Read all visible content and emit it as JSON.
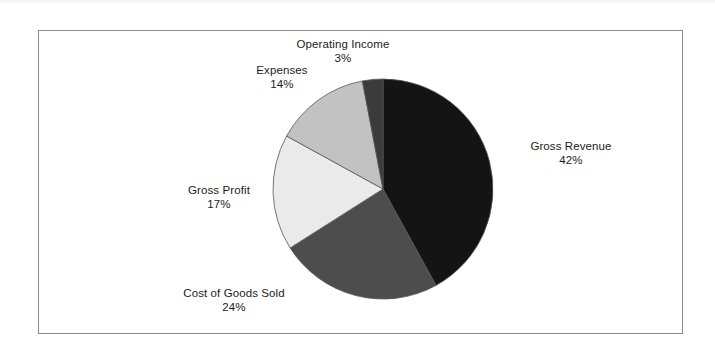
{
  "chart_data": {
    "type": "pie",
    "title": "",
    "subtitle": "",
    "legend_position": "none",
    "labels_position": "outside",
    "grid": false,
    "total": 100,
    "units": "%",
    "categories": [
      "Gross Revenue",
      "Cost of Goods Sold",
      "Gross Profit",
      "Expenses",
      "Operating Income"
    ],
    "values": [
      42,
      24,
      17,
      14,
      3
    ],
    "start_angle_deg": 0,
    "direction": "clockwise",
    "slices": [
      {
        "name": "gross-revenue",
        "label": "Gross Revenue",
        "value": 42,
        "value_text": "42%",
        "color": "#141414",
        "start_deg": 0,
        "end_deg": 151.2
      },
      {
        "name": "cost-of-goods-sold",
        "label": "Cost of Goods Sold",
        "value": 24,
        "value_text": "24%",
        "color": "#4d4d4d",
        "start_deg": 151.2,
        "end_deg": 237.6
      },
      {
        "name": "gross-profit",
        "label": "Gross Profit",
        "value": 17,
        "value_text": "17%",
        "color": "#eaeaea",
        "start_deg": 237.6,
        "end_deg": 298.8
      },
      {
        "name": "expenses",
        "label": "Expenses",
        "value": 14,
        "value_text": "14%",
        "color": "#c2c2c2",
        "start_deg": 298.8,
        "end_deg": 349.2
      },
      {
        "name": "operating-income",
        "label": "Operating Income",
        "value": 3,
        "value_text": "3%",
        "color": "#3b3b3b",
        "start_deg": 349.2,
        "end_deg": 360
      }
    ],
    "xlabel": "",
    "ylabel": ""
  },
  "frame": {
    "border_color": "#8a8a8a",
    "background": "#ffffff"
  }
}
